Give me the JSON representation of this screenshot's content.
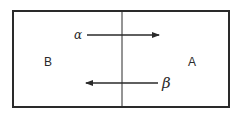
{
  "diagram": {
    "regions": [
      {
        "id": "left",
        "label": "B"
      },
      {
        "id": "right",
        "label": "A"
      }
    ],
    "arrows": [
      {
        "label": "α",
        "direction": "left-to-right",
        "from": "B",
        "to": "A"
      },
      {
        "label": "β",
        "direction": "right-to-left",
        "from": "A",
        "to": "B"
      }
    ],
    "colors": {
      "stroke": "#2a2a2a",
      "background": "#ffffff"
    }
  }
}
